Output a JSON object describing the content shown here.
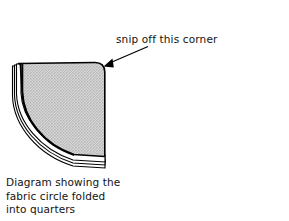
{
  "figure": {
    "background_color": "#ffffff",
    "ink_color": "#000000",
    "annotation": {
      "text": "snip off this corner",
      "arrow": {
        "name": "leader-arrow",
        "from_x": 148,
        "from_y": 47,
        "to_x": 104,
        "to_y": 66
      }
    },
    "caption": {
      "lines": [
        "Diagram showing the",
        "fabric circle folded",
        "into quarters"
      ]
    },
    "shape": {
      "name": "quarter-circle-folded-fabric",
      "description": "fabric circle folded into quarters",
      "fill_color": "#c9c9c9",
      "outline_color": "#000000",
      "snipped_corner": "top-right",
      "fold_layer_count": 3,
      "top_edge_y": 63,
      "right_edge_x": 105,
      "left_edge_x": 18,
      "bottom_y": 160
    }
  }
}
